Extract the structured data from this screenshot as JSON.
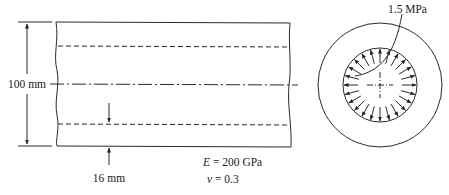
{
  "figure": {
    "side_view": {
      "height_label": "100 mm",
      "thickness_label": "16 mm"
    },
    "material": {
      "E_symbol": "E",
      "E_value": " = 200 GPa",
      "nu_symbol": "ν",
      "nu_value": " = 0.3"
    },
    "cross_section": {
      "pressure_label": "1.5 MPa",
      "arrow_count": 24
    },
    "colors": {
      "line": "#2a2a2a",
      "background": "#ffffff"
    }
  }
}
